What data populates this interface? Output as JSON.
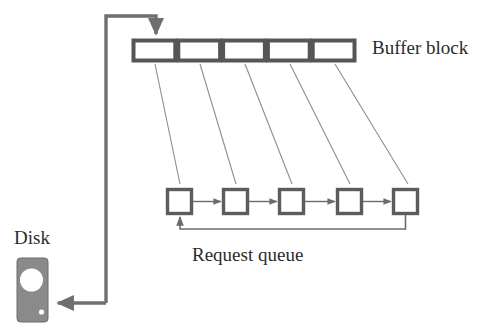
{
  "diagram": {
    "labels": {
      "buffer_block": "Buffer block",
      "request_queue": "Request queue",
      "disk": "Disk"
    },
    "colors": {
      "stroke_dark": "#565656",
      "stroke_thin": "#6b6b6b",
      "disk_fill": "#8a8a8a",
      "disk_platter": "#ffffff",
      "text": "#2b2b2b",
      "background": "#ffffff"
    },
    "buffer_block": {
      "cell_count": 5,
      "cells": [
        {
          "index": 1,
          "label": ""
        },
        {
          "index": 2,
          "label": ""
        },
        {
          "index": 3,
          "label": ""
        },
        {
          "index": 4,
          "label": ""
        },
        {
          "index": 5,
          "label": ""
        }
      ],
      "geometry": {
        "x": 132,
        "y": 39,
        "width": 224,
        "height": 23,
        "cell_width": 44.8
      }
    },
    "request_queue": {
      "node_count": 5,
      "nodes": [
        {
          "index": 1,
          "label": ""
        },
        {
          "index": 2,
          "label": ""
        },
        {
          "index": 3,
          "label": ""
        },
        {
          "index": 4,
          "label": ""
        },
        {
          "index": 5,
          "label": ""
        }
      ],
      "geometry": {
        "y": 188,
        "size": 27,
        "x_positions": [
          166,
          222,
          278,
          336,
          392
        ]
      },
      "feedback_loop": true
    },
    "connectors": {
      "buffer_to_queue_count": 5,
      "disk_to_buffer": "arrow up and right into first buffer cell",
      "queue_to_disk": "arrow down and left into disk"
    },
    "disk_icon": {
      "name": "disk-drive-icon",
      "geometry": {
        "x": 17,
        "y": 258,
        "width": 31,
        "height": 64
      },
      "has_platter": true,
      "has_indicator_light": true
    }
  }
}
